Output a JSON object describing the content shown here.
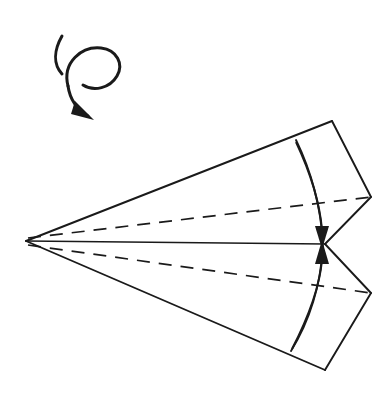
{
  "figure": {
    "background_color": "#ffffff",
    "ink_color": "#1a1a1a",
    "canvas": {
      "width": 392,
      "height": 395
    }
  },
  "geometry": {
    "apex": {
      "x": 26,
      "y": 241
    },
    "center_point": {
      "x": 325,
      "y": 244
    },
    "top_corner": {
      "x": 332,
      "y": 121
    },
    "bottom_corner": {
      "x": 325,
      "y": 370
    },
    "right_upper_vertex": {
      "x": 371,
      "y": 197
    },
    "right_lower_vertex": {
      "x": 371,
      "y": 293
    },
    "arc_top_end": {
      "x": 296,
      "y": 140
    },
    "arc_bottom_end": {
      "x": 291,
      "y": 351
    },
    "arc_bulge": {
      "x": 322,
      "y": 245
    }
  },
  "paths": {
    "outline_upper": "M 26 241 L 332 121 L 371 197 L 325 244 Z",
    "outline_lower": "M 26 241 L 325 370 L 371 293 L 325 244 Z",
    "edge_top": "M 26 241 L 332 121",
    "edge_bottom": "M 26 241 L 325 370",
    "edge_top_right_upper": "M 332 121 L 371 197",
    "edge_right_upper_to_center": "M 371 197 L 325 244",
    "edge_center_to_right_lower": "M 325 244 L 371 293",
    "edge_right_lower_to_bottom": "M 371 293 L 325 370",
    "center_axis": "M 26 241 L 325 244",
    "crease_arc_upper": "M 296 140 C 313 175, 321 212, 323 243",
    "crease_arc_lower": "M 323 246 C 321 279, 312 317, 291 351",
    "dashed_upper": "M 28 238 L 371 197",
    "dashed_lower": "M 28 245 L 371 293"
  },
  "creases": [
    {
      "name": "upper-valley-crease",
      "style": "dashed",
      "label": "valley fold line (upper wing)"
    },
    {
      "name": "lower-valley-crease",
      "style": "dashed",
      "label": "valley fold line (lower wing)"
    },
    {
      "name": "curved-crease",
      "style": "solid",
      "label": "curved folded edge"
    },
    {
      "name": "center-axis",
      "style": "solid",
      "label": "center spine"
    }
  ],
  "arrows": {
    "fold_down": {
      "name": "fold-arrow-down",
      "label": "fold upper flap down to center",
      "shaft": "M 296 142 C 312 176, 320 206, 322 232",
      "head_points": "315,228 329,228 322,248",
      "direction": "down"
    },
    "fold_up": {
      "name": "fold-arrow-up",
      "label": "fold lower flap up to center",
      "shaft": "M 292 349 C 310 314, 320 283, 322 258",
      "head_points": "315,262 329,262 322,241",
      "direction": "up"
    },
    "rotate": {
      "name": "rotate-arrow",
      "label": "turn the model over / rotate",
      "tail_stroke": "M 62 36 C 54 50, 53 64, 62 74",
      "loop_stroke": "M 68 86 C 62 62, 82 46, 101 48 C 117 50, 124 64, 117 76 C 110 88, 94 92, 83 85",
      "descend_stroke": "M 68 86 C 70 100, 78 110, 88 116",
      "head_points": "79,105 96,119 74,119",
      "head_rotation": 36
    }
  },
  "labels": {
    "step_number": "",
    "caption": ""
  }
}
